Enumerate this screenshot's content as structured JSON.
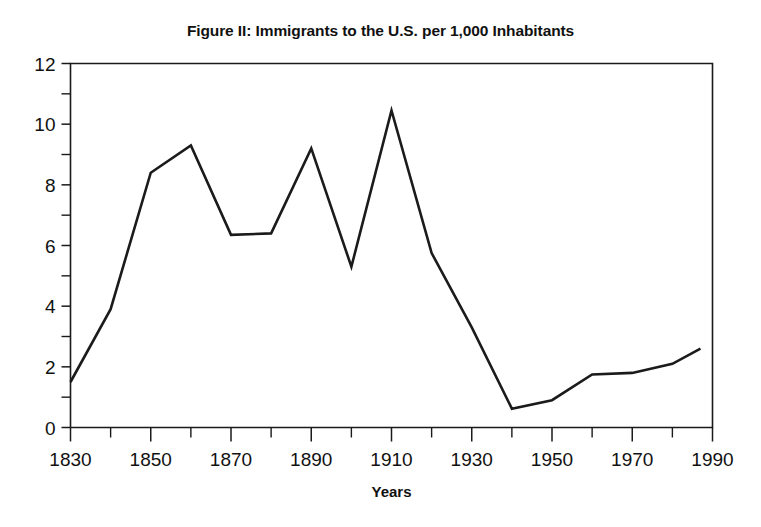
{
  "figure": {
    "title": "Figure II: Immigrants to the U.S. per 1,000 Inhabitants",
    "x_axis_label": "Years"
  },
  "chart_data": {
    "type": "line",
    "title": "Figure II: Immigrants to the U.S. per 1,000 Inhabitants",
    "xlabel": "Years",
    "ylabel": "",
    "xlim": [
      1830,
      1990
    ],
    "ylim": [
      0,
      12
    ],
    "grid": false,
    "legend": null,
    "line_color": "#1b1b1b",
    "x_major_ticks": [
      1830,
      1850,
      1870,
      1890,
      1910,
      1930,
      1950,
      1970,
      1990
    ],
    "x_minor_ticks": [
      1840,
      1860,
      1880,
      1900,
      1920,
      1940,
      1960,
      1980
    ],
    "x_tick_labels": [
      "1830",
      "1850",
      "1870",
      "1890",
      "1910",
      "1930",
      "1950",
      "1970",
      "1990"
    ],
    "y_major_ticks": [
      0,
      2,
      4,
      6,
      8,
      10,
      12
    ],
    "y_minor_ticks": [
      1,
      3,
      5,
      7,
      9,
      11
    ],
    "y_tick_labels": [
      "0",
      "2",
      "4",
      "6",
      "8",
      "10",
      "12"
    ],
    "x": [
      1830,
      1840,
      1850,
      1860,
      1870,
      1880,
      1890,
      1900,
      1910,
      1920,
      1930,
      1940,
      1950,
      1960,
      1970,
      1980,
      1987
    ],
    "values": [
      1.5,
      3.9,
      8.4,
      9.3,
      6.35,
      6.4,
      9.2,
      5.3,
      10.45,
      5.75,
      3.3,
      0.62,
      0.9,
      1.75,
      1.8,
      2.1,
      2.6
    ],
    "series": [
      {
        "name": "Immigrants per 1,000 inhabitants",
        "values": [
          1.5,
          3.9,
          8.4,
          9.3,
          6.35,
          6.4,
          9.2,
          5.3,
          10.45,
          5.75,
          3.3,
          0.62,
          0.9,
          1.75,
          1.8,
          2.1,
          2.6
        ]
      }
    ]
  }
}
